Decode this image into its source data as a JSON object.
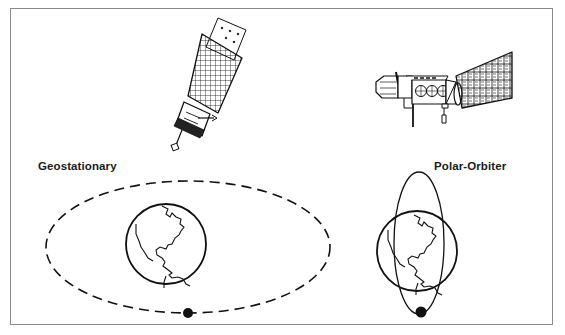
{
  "diagram": {
    "panels": [
      {
        "id": "geostationary",
        "label": "Geostationary",
        "satellite_icon": "geostationary-satellite-icon",
        "orbit": {
          "type": "equatorial",
          "style": "dashed"
        }
      },
      {
        "id": "polar-orbiter",
        "label": "Polar-Orbiter",
        "satellite_icon": "polar-orbiter-satellite-icon",
        "orbit": {
          "type": "polar",
          "style": "solid"
        }
      }
    ],
    "colors": {
      "line": "#111111",
      "border": "#8a8a8a",
      "background": "#ffffff"
    }
  }
}
